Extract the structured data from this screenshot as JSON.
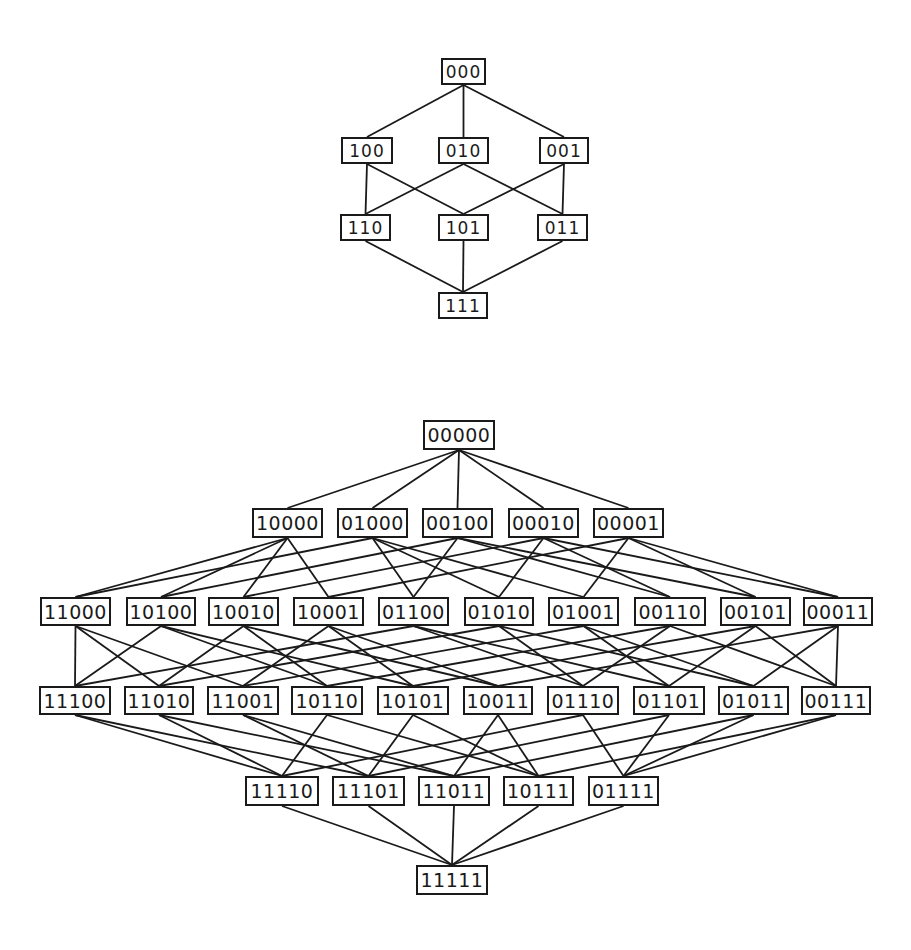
{
  "colors": {
    "ink": "#1a1a1a",
    "paper": "#ffffff"
  },
  "diagrams": [
    {
      "name": "hypercube-lattice-3",
      "dimension": 3,
      "size_class": "small",
      "levels": [
        [
          {
            "label": "000",
            "x": 441,
            "y": 58,
            "w": 45,
            "h": 27
          }
        ],
        [
          {
            "label": "100",
            "x": 341,
            "y": 137,
            "w": 52,
            "h": 27
          },
          {
            "label": "010",
            "x": 438,
            "y": 137,
            "w": 51,
            "h": 27
          },
          {
            "label": "001",
            "x": 539,
            "y": 137,
            "w": 50,
            "h": 27
          }
        ],
        [
          {
            "label": "110",
            "x": 340,
            "y": 214,
            "w": 51,
            "h": 27
          },
          {
            "label": "101",
            "x": 438,
            "y": 214,
            "w": 51,
            "h": 27
          },
          {
            "label": "011",
            "x": 537,
            "y": 214,
            "w": 51,
            "h": 27
          }
        ],
        [
          {
            "label": "111",
            "x": 438,
            "y": 292,
            "w": 50,
            "h": 27
          }
        ]
      ]
    },
    {
      "name": "hypercube-lattice-5",
      "dimension": 5,
      "size_class": "large",
      "levels": [
        [
          {
            "label": "00000",
            "x": 423,
            "y": 420,
            "w": 72,
            "h": 30
          }
        ],
        [
          {
            "label": "10000",
            "x": 252,
            "y": 508,
            "w": 71,
            "h": 30
          },
          {
            "label": "01000",
            "x": 337,
            "y": 508,
            "w": 71,
            "h": 30
          },
          {
            "label": "00100",
            "x": 422,
            "y": 508,
            "w": 71,
            "h": 30
          },
          {
            "label": "00010",
            "x": 508,
            "y": 508,
            "w": 71,
            "h": 30
          },
          {
            "label": "00001",
            "x": 593,
            "y": 508,
            "w": 71,
            "h": 30
          }
        ],
        [
          {
            "label": "11000",
            "x": 40,
            "y": 597,
            "w": 71,
            "h": 29
          },
          {
            "label": "10100",
            "x": 126,
            "y": 597,
            "w": 70,
            "h": 29
          },
          {
            "label": "10010",
            "x": 208,
            "y": 597,
            "w": 71,
            "h": 29
          },
          {
            "label": "10001",
            "x": 293,
            "y": 597,
            "w": 71,
            "h": 29
          },
          {
            "label": "01100",
            "x": 378,
            "y": 597,
            "w": 71,
            "h": 29
          },
          {
            "label": "01010",
            "x": 464,
            "y": 597,
            "w": 70,
            "h": 29
          },
          {
            "label": "01001",
            "x": 548,
            "y": 597,
            "w": 71,
            "h": 29
          },
          {
            "label": "00110",
            "x": 634,
            "y": 597,
            "w": 72,
            "h": 29
          },
          {
            "label": "00101",
            "x": 720,
            "y": 597,
            "w": 71,
            "h": 29
          },
          {
            "label": "00011",
            "x": 803,
            "y": 597,
            "w": 70,
            "h": 29
          }
        ],
        [
          {
            "label": "11100",
            "x": 39,
            "y": 686,
            "w": 72,
            "h": 29
          },
          {
            "label": "11010",
            "x": 124,
            "y": 686,
            "w": 70,
            "h": 29
          },
          {
            "label": "11001",
            "x": 207,
            "y": 686,
            "w": 72,
            "h": 29
          },
          {
            "label": "10110",
            "x": 291,
            "y": 686,
            "w": 72,
            "h": 29
          },
          {
            "label": "10101",
            "x": 377,
            "y": 686,
            "w": 72,
            "h": 29
          },
          {
            "label": "10011",
            "x": 463,
            "y": 686,
            "w": 70,
            "h": 29
          },
          {
            "label": "01110",
            "x": 547,
            "y": 686,
            "w": 72,
            "h": 29
          },
          {
            "label": "01101",
            "x": 633,
            "y": 686,
            "w": 72,
            "h": 29
          },
          {
            "label": "01011",
            "x": 718,
            "y": 686,
            "w": 71,
            "h": 29
          },
          {
            "label": "00111",
            "x": 801,
            "y": 686,
            "w": 70,
            "h": 29
          }
        ],
        [
          {
            "label": "11110",
            "x": 245,
            "y": 776,
            "w": 74,
            "h": 30
          },
          {
            "label": "11101",
            "x": 332,
            "y": 776,
            "w": 73,
            "h": 30
          },
          {
            "label": "11011",
            "x": 418,
            "y": 776,
            "w": 72,
            "h": 30
          },
          {
            "label": "10111",
            "x": 503,
            "y": 776,
            "w": 71,
            "h": 30
          },
          {
            "label": "01111",
            "x": 588,
            "y": 776,
            "w": 71,
            "h": 30
          }
        ],
        [
          {
            "label": "11111",
            "x": 416,
            "y": 865,
            "w": 72,
            "h": 30
          }
        ]
      ]
    }
  ],
  "edge_rule": "connect nodes in adjacent levels whose labels differ in exactly one bit"
}
